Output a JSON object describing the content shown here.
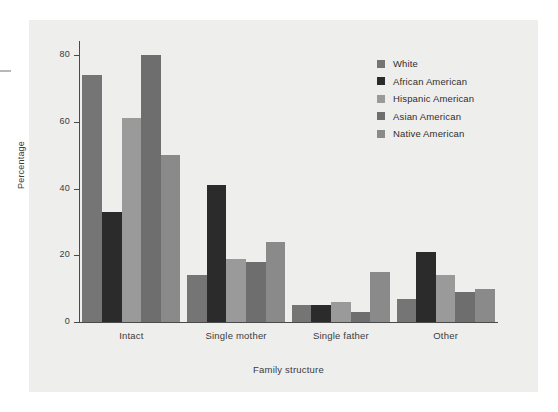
{
  "chart_data": {
    "type": "bar",
    "title": "",
    "xlabel": "Family structure",
    "ylabel": "Percentage",
    "categories": [
      "Intact",
      "Single mother",
      "Single father",
      "Other"
    ],
    "ylim": [
      0,
      85
    ],
    "yticks": [
      0,
      20,
      40,
      60,
      80
    ],
    "ytick_labels": [
      "0",
      "20",
      "40",
      "60",
      "80"
    ],
    "grid": false,
    "legend_position": "top-right",
    "series": [
      {
        "name": "White",
        "color": "#757575",
        "values": [
          74,
          14,
          5,
          7
        ]
      },
      {
        "name": "African American",
        "color": "#2b2b2b",
        "values": [
          33,
          41,
          5,
          21
        ]
      },
      {
        "name": "Hispanic American",
        "color": "#9a9a9a",
        "values": [
          61,
          19,
          6,
          14
        ]
      },
      {
        "name": "Asian American",
        "color": "#6e6e6e",
        "values": [
          80,
          18,
          3,
          9
        ]
      },
      {
        "name": "Native American",
        "color": "#8a8a8a",
        "values": [
          50,
          24,
          15,
          10
        ]
      }
    ]
  },
  "figure": {
    "panel_background": "#eeeeec",
    "page_background": "#ffffff",
    "axis_color": "#4a4a4a",
    "text_color": "#3b3b3b"
  }
}
